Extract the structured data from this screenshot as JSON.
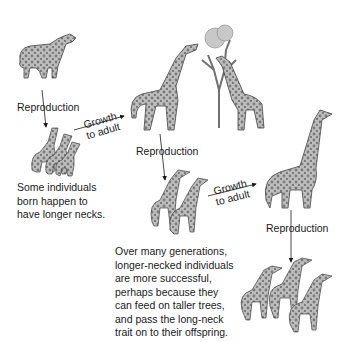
{
  "diagram": {
    "labels": {
      "reproduction_1": "Reproduction",
      "growth_1_line1": "Growth",
      "growth_1_line2": "to adult",
      "reproduction_2": "Reproduction",
      "growth_2_line1": "Growth",
      "growth_2_line2": "to adult",
      "reproduction_3": "Reproduction"
    },
    "captions": {
      "longer_necks": "Some individuals\nborn happen to\nhave longer necks.",
      "selection": "Over many generations,\nlonger-necked individuals\nare more successful,\nperhaps because they\ncan feed on taller trees,\nand pass the long-neck\ntrait on to their offspring."
    },
    "figures": [
      "short-neck ancestor giraffe",
      "offspring group of three",
      "two adult giraffes feeding on tree",
      "two juvenile giraffes",
      "long-neck adult giraffe",
      "offspring group of three long-neck"
    ],
    "colors": {
      "ink": "#1a1a1a",
      "giraffe_fill": "#b8b8b8",
      "spots": "#6e6e6e",
      "tree": "#7a7a7a"
    }
  }
}
